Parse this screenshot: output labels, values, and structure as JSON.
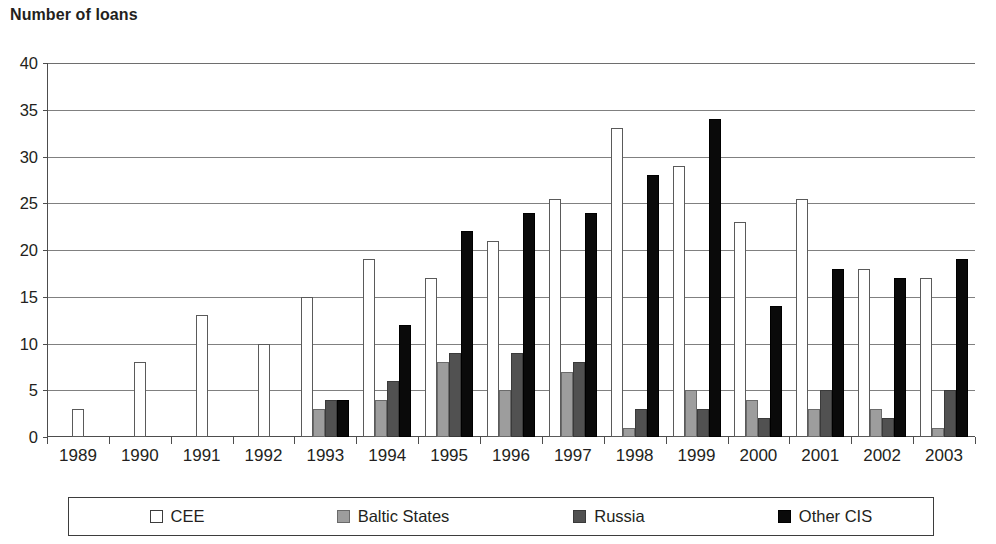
{
  "chart_data": {
    "type": "bar",
    "title": "Number of loans",
    "xlabel": "",
    "ylabel": "",
    "ylim": [
      0,
      40
    ],
    "yticks": [
      0,
      5,
      10,
      15,
      20,
      25,
      30,
      35,
      40
    ],
    "grid": true,
    "legend_position": "bottom",
    "categories": [
      "1989",
      "1990",
      "1991",
      "1992",
      "1993",
      "1994",
      "1995",
      "1996",
      "1997",
      "1998",
      "1999",
      "2000",
      "2001",
      "2002",
      "2003"
    ],
    "series": [
      {
        "name": "CEE",
        "color": "#ffffff",
        "values": [
          3,
          8,
          13,
          10,
          15,
          19,
          17,
          21,
          25.5,
          33,
          29,
          23,
          25.5,
          18,
          17
        ]
      },
      {
        "name": "Baltic States",
        "color": "#9d9d9d",
        "values": [
          0,
          0,
          0,
          0,
          3,
          4,
          8,
          5,
          7,
          1,
          5,
          4,
          3,
          3,
          1
        ]
      },
      {
        "name": "Russia",
        "color": "#515151",
        "values": [
          0,
          0,
          0,
          0,
          4,
          6,
          9,
          9,
          8,
          3,
          3,
          2,
          5,
          2,
          5
        ]
      },
      {
        "name": "Other CIS",
        "color": "#0a0a0a",
        "values": [
          0,
          0,
          0,
          0,
          4,
          12,
          22,
          24,
          24,
          28,
          34,
          14,
          18,
          17,
          19
        ]
      }
    ]
  },
  "legend": {
    "items": [
      {
        "label": "CEE"
      },
      {
        "label": "Baltic States"
      },
      {
        "label": "Russia"
      },
      {
        "label": "Other CIS"
      }
    ]
  }
}
